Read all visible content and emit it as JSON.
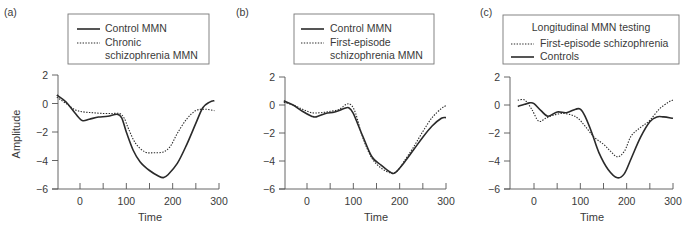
{
  "chart_data": [
    {
      "type": "line",
      "panel_label": "(a)",
      "title": "",
      "xlabel": "Time",
      "ylabel": "Amplitude",
      "xlim": [
        -50,
        300
      ],
      "ylim": [
        -6,
        2
      ],
      "x_ticks": [
        0,
        100,
        200,
        300
      ],
      "x_minor_ticks": [
        50,
        150,
        250
      ],
      "y_ticks": [
        2,
        0,
        -2,
        -4,
        -6
      ],
      "grid": false,
      "legend": {
        "title": "",
        "entries": [
          {
            "label": "Control MMN",
            "style": "solid"
          },
          {
            "label": "Chronic",
            "style": "dotted",
            "continuation": "schizophrenia MMN"
          }
        ]
      },
      "series": [
        {
          "name": "Control MMN",
          "style": "solid",
          "x": [
            -50,
            -30,
            -10,
            5,
            20,
            40,
            60,
            80,
            90,
            100,
            115,
            130,
            150,
            170,
            180,
            190,
            210,
            230,
            250,
            265,
            280,
            290
          ],
          "y": [
            0.6,
            0.1,
            -0.7,
            -1.2,
            -1.1,
            -0.95,
            -0.9,
            -0.75,
            -1.0,
            -2.0,
            -3.3,
            -4.1,
            -4.7,
            -5.1,
            -5.2,
            -5.0,
            -4.2,
            -2.9,
            -1.4,
            -0.3,
            0.1,
            0.2
          ]
        },
        {
          "name": "Chronic schizophrenia MMN",
          "style": "dotted",
          "x": [
            -50,
            -30,
            -10,
            10,
            30,
            50,
            70,
            85,
            95,
            105,
            120,
            140,
            160,
            180,
            195,
            210,
            230,
            250,
            270,
            290
          ],
          "y": [
            0.45,
            0.0,
            -0.45,
            -0.6,
            -0.65,
            -0.7,
            -0.7,
            -0.7,
            -1.0,
            -1.8,
            -2.8,
            -3.4,
            -3.45,
            -3.4,
            -3.0,
            -2.1,
            -1.1,
            -0.5,
            -0.4,
            -0.5
          ]
        }
      ]
    },
    {
      "type": "line",
      "panel_label": "(b)",
      "title": "",
      "xlabel": "Time",
      "ylabel": "",
      "xlim": [
        -50,
        300
      ],
      "ylim": [
        -6,
        2
      ],
      "x_ticks": [
        0,
        100,
        200,
        300
      ],
      "x_minor_ticks": [
        50,
        150,
        250
      ],
      "y_ticks": [
        2,
        0,
        -2,
        -4,
        -6
      ],
      "grid": false,
      "legend": {
        "title": "",
        "entries": [
          {
            "label": "Control MMN",
            "style": "solid"
          },
          {
            "label": "First-episode",
            "style": "dotted",
            "continuation": "schizophrenia MMN"
          }
        ]
      },
      "series": [
        {
          "name": "Control MMN",
          "style": "solid",
          "x": [
            -50,
            -30,
            -10,
            10,
            20,
            40,
            60,
            80,
            90,
            100,
            120,
            140,
            160,
            180,
            190,
            210,
            230,
            250,
            270,
            290,
            300
          ],
          "y": [
            0.3,
            0.0,
            -0.45,
            -0.8,
            -0.85,
            -0.6,
            -0.5,
            -0.25,
            -0.2,
            -0.6,
            -2.2,
            -3.7,
            -4.3,
            -4.8,
            -4.85,
            -4.1,
            -3.2,
            -2.3,
            -1.5,
            -0.95,
            -0.9
          ]
        },
        {
          "name": "First-episode schizophrenia MMN",
          "style": "dotted",
          "x": [
            -50,
            -30,
            -10,
            10,
            30,
            50,
            70,
            85,
            95,
            105,
            120,
            140,
            160,
            180,
            195,
            210,
            230,
            250,
            270,
            290,
            300
          ],
          "y": [
            0.2,
            0.0,
            -0.3,
            -0.55,
            -0.55,
            -0.45,
            -0.3,
            0.05,
            0.0,
            -0.6,
            -2.3,
            -3.8,
            -4.5,
            -4.85,
            -4.7,
            -4.0,
            -3.0,
            -1.9,
            -0.9,
            -0.25,
            -0.05
          ]
        }
      ]
    },
    {
      "type": "line",
      "panel_label": "(c)",
      "title": "",
      "xlabel": "Time",
      "ylabel": "",
      "xlim": [
        -50,
        300
      ],
      "ylim": [
        -6,
        2
      ],
      "x_ticks": [
        0,
        100,
        200,
        300
      ],
      "x_minor_ticks": [
        50,
        150,
        250
      ],
      "y_ticks": [
        2,
        0,
        -2,
        -4,
        -6
      ],
      "grid": false,
      "legend": {
        "title": "Longitudinal MMN testing",
        "entries": [
          {
            "label": "First-episode schizophrenia",
            "style": "dotted"
          },
          {
            "label": "Controls",
            "style": "solid"
          }
        ]
      },
      "series": [
        {
          "name": "Controls",
          "style": "solid",
          "x": [
            -35,
            -20,
            -10,
            0,
            15,
            30,
            50,
            70,
            90,
            100,
            110,
            125,
            140,
            160,
            180,
            195,
            210,
            230,
            250,
            265,
            280,
            300
          ],
          "y": [
            -0.1,
            0.05,
            0.15,
            0.1,
            -0.4,
            -0.8,
            -0.5,
            -0.55,
            -0.3,
            -0.3,
            -0.8,
            -2.0,
            -3.4,
            -4.6,
            -5.2,
            -4.9,
            -3.8,
            -2.3,
            -1.2,
            -0.85,
            -0.85,
            -0.95
          ]
        },
        {
          "name": "First-episode schizophrenia",
          "style": "dotted",
          "x": [
            -35,
            -20,
            -5,
            10,
            25,
            40,
            60,
            80,
            95,
            110,
            130,
            150,
            165,
            180,
            195,
            210,
            230,
            250,
            270,
            290,
            300
          ],
          "y": [
            0.35,
            0.35,
            -0.3,
            -1.15,
            -0.95,
            -0.75,
            -0.6,
            -0.7,
            -0.95,
            -1.5,
            -2.3,
            -2.8,
            -3.3,
            -3.7,
            -3.3,
            -2.2,
            -1.6,
            -1.1,
            -0.3,
            0.2,
            0.35
          ]
        }
      ]
    }
  ]
}
